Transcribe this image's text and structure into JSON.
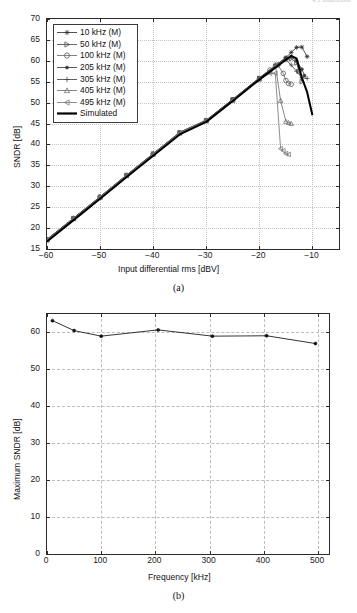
{
  "running_header": "4.3  Simulations",
  "figures": [
    {
      "id": "fig-a",
      "caption": "(a)",
      "xlabel": "Input differential rms [dBV]",
      "ylabel": "SNDR [dB]",
      "xticks": [
        -60,
        -50,
        -40,
        -30,
        -20,
        -10
      ],
      "xticklabels": [
        "−60",
        "−50",
        "−40",
        "−30",
        "−20",
        "−10"
      ],
      "yticks": [
        15,
        20,
        25,
        30,
        35,
        40,
        45,
        50,
        55,
        60,
        65,
        70
      ],
      "yticklabels": [
        "15",
        "20",
        "25",
        "30",
        "35",
        "40",
        "45",
        "50",
        "55",
        "60",
        "65",
        "70"
      ],
      "legend_items": [
        {
          "label": "10 kHz (M)",
          "marker": "star"
        },
        {
          "label": "50 kHz (M)",
          "marker": "triangle-right"
        },
        {
          "label": "100 kHz (M)",
          "marker": "circle"
        },
        {
          "label": "205 kHz (M)",
          "marker": "dot"
        },
        {
          "label": "305 kHz (M)",
          "marker": "plus"
        },
        {
          "label": "405 kHz (M)",
          "marker": "triangle-up"
        },
        {
          "label": "495 kHz (M)",
          "marker": "triangle-left"
        },
        {
          "label": "Simulated",
          "marker": "thickline"
        }
      ]
    },
    {
      "id": "fig-b",
      "caption": "(b)",
      "xlabel": "Frequency [kHz]",
      "ylabel": "Maximum SNDR [dB]",
      "xticks": [
        0,
        100,
        200,
        300,
        400,
        500
      ],
      "xticklabels": [
        "0",
        "100",
        "200",
        "300",
        "400",
        "500"
      ],
      "yticks": [
        0,
        10,
        20,
        30,
        40,
        50,
        60
      ],
      "yticklabels": [
        "0",
        "10",
        "20",
        "30",
        "40",
        "50",
        "60"
      ]
    }
  ],
  "chart_data": [
    {
      "type": "line",
      "id": "fig-a",
      "title": "",
      "xlabel": "Input differential rms [dBV]",
      "ylabel": "SNDR [dB]",
      "xlim": [
        -60,
        -5
      ],
      "ylim": [
        15,
        70
      ],
      "grid": true,
      "legend_position": "upper-left",
      "series": [
        {
          "name": "10 kHz (M)",
          "marker": "star",
          "color": "#333333",
          "x": [
            -60,
            -55,
            -50,
            -45,
            -40,
            -35,
            -30,
            -25,
            -20,
            -17,
            -15,
            -14,
            -13,
            -12,
            -11
          ],
          "y": [
            17.3,
            22.4,
            27.5,
            32.7,
            37.8,
            42.9,
            45.8,
            50.8,
            55.9,
            58.8,
            60.8,
            62.0,
            63.2,
            63.3,
            61.0
          ]
        },
        {
          "name": "50 kHz (M)",
          "marker": "triangle-right",
          "color": "#4d4d4d",
          "x": [
            -60,
            -55,
            -50,
            -45,
            -40,
            -35,
            -30,
            -25,
            -20,
            -17,
            -15,
            -14,
            -13,
            -12.5,
            -12
          ],
          "y": [
            17.2,
            22.3,
            27.4,
            32.6,
            37.7,
            42.8,
            45.7,
            50.7,
            55.8,
            58.7,
            60.4,
            60.5,
            59.5,
            57.5,
            55.0
          ]
        },
        {
          "name": "100 kHz (M)",
          "marker": "circle",
          "color": "#6b6b6b",
          "x": [
            -60,
            -55,
            -50,
            -45,
            -40,
            -35,
            -30,
            -25,
            -20,
            -18,
            -16.5,
            -15.5,
            -15,
            -14.5,
            -14
          ],
          "y": [
            17.2,
            22.3,
            27.4,
            32.6,
            37.7,
            42.8,
            45.7,
            50.7,
            55.7,
            57.8,
            59.0,
            57.0,
            55.3,
            54.6,
            54.4
          ]
        },
        {
          "name": "205 kHz (M)",
          "marker": "dot",
          "color": "#3a3a3a",
          "x": [
            -60,
            -55,
            -50,
            -45,
            -40,
            -35,
            -30,
            -25,
            -20,
            -17,
            -15,
            -14,
            -13,
            -12,
            -11.5
          ],
          "y": [
            17.3,
            22.4,
            27.5,
            32.7,
            37.8,
            42.9,
            45.8,
            50.8,
            55.9,
            58.9,
            60.7,
            61.0,
            60.0,
            58.0,
            56.5
          ]
        },
        {
          "name": "305 kHz (M)",
          "marker": "plus",
          "color": "#444444",
          "x": [
            -60,
            -55,
            -50,
            -45,
            -40,
            -35,
            -30,
            -25,
            -20,
            -17,
            -15,
            -14,
            -13,
            -12,
            -11
          ],
          "y": [
            17.2,
            22.3,
            27.4,
            32.6,
            37.7,
            42.8,
            45.7,
            50.7,
            55.8,
            58.7,
            60.2,
            59.0,
            57.5,
            56.0,
            55.8
          ]
        },
        {
          "name": "405 kHz (M)",
          "marker": "triangle-up",
          "color": "#707070",
          "x": [
            -60,
            -55,
            -50,
            -45,
            -40,
            -35,
            -30,
            -25,
            -20,
            -18,
            -17,
            -16,
            -15,
            -14.5,
            -14
          ],
          "y": [
            17.2,
            22.3,
            27.4,
            32.6,
            37.7,
            42.8,
            45.7,
            50.6,
            55.7,
            57.5,
            59.1,
            50.5,
            45.5,
            45.2,
            45.0
          ]
        },
        {
          "name": "495 kHz (M)",
          "marker": "triangle-left",
          "color": "#7a7a7a",
          "x": [
            -60,
            -55,
            -50,
            -45,
            -40,
            -35,
            -30,
            -25,
            -20,
            -18,
            -17,
            -16,
            -15.5,
            -15,
            -14.5
          ],
          "y": [
            17.1,
            22.2,
            27.3,
            32.5,
            37.6,
            42.7,
            45.6,
            50.5,
            55.6,
            57.0,
            57.0,
            39.0,
            38.5,
            37.8,
            37.6
          ]
        },
        {
          "name": "Simulated",
          "marker": "none",
          "color": "#000000",
          "linewidth": 2,
          "x": [
            -60,
            -55,
            -50,
            -45,
            -40,
            -35,
            -30,
            -25,
            -20,
            -16,
            -14,
            -13,
            -12,
            -11,
            -10
          ],
          "y": [
            16.8,
            21.9,
            27.0,
            32.2,
            37.3,
            42.4,
            45.4,
            50.4,
            55.5,
            59.3,
            61.2,
            60.6,
            56.0,
            52.5,
            47.0
          ]
        }
      ]
    },
    {
      "type": "line",
      "id": "fig-b",
      "title": "",
      "xlabel": "Frequency [kHz]",
      "ylabel": "Maximum SNDR [dB]",
      "xlim": [
        0,
        520
      ],
      "ylim": [
        0,
        65
      ],
      "grid": true,
      "legend_position": "none",
      "series": [
        {
          "name": "Maximum SNDR",
          "marker": "dot",
          "color": "#111111",
          "x": [
            10,
            50,
            100,
            205,
            305,
            405,
            495
          ],
          "y": [
            63.2,
            60.5,
            59.0,
            60.7,
            59.0,
            59.1,
            57.0
          ]
        }
      ]
    }
  ]
}
